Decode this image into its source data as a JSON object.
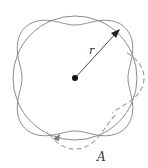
{
  "diagram": {
    "type": "standing-wave-orbit",
    "labels": {
      "radius": "r",
      "point": "A"
    },
    "geometry": {
      "center": [
        75,
        78
      ],
      "radius": 62,
      "wave_count": 4,
      "wave_amplitude": 9
    },
    "colors": {
      "circle": "#8a8a8a",
      "wave": "#8a8a8a",
      "dashed_wave": "#9a9a9a",
      "center_dot": "#111111",
      "radius_arrow": "#333333"
    }
  }
}
